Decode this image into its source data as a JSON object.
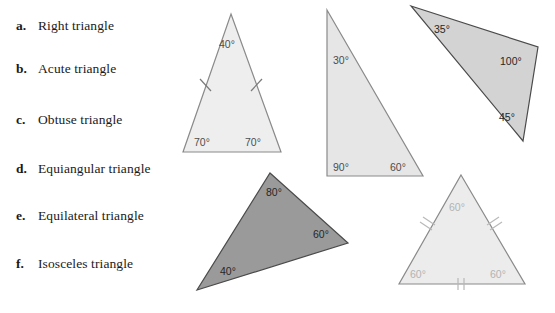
{
  "choices": [
    {
      "letter": "a.",
      "label": "Right triangle"
    },
    {
      "letter": "b.",
      "label": "Acute triangle"
    },
    {
      "letter": "c.",
      "label": "Obtuse triangle"
    },
    {
      "letter": "d.",
      "label": "Equiangular triangle"
    },
    {
      "letter": "e.",
      "label": "Equilateral triangle"
    },
    {
      "letter": "f.",
      "label": "Isosceles triangle"
    }
  ],
  "figures": {
    "isosceles": {
      "name": "isosceles-triangle",
      "fill": "#eeeeee",
      "angles": {
        "apex": "40°",
        "base_left": "70°",
        "base_right": "70°"
      },
      "tick_marks": "single tick on each of the two congruent legs"
    },
    "right": {
      "name": "right-triangle",
      "fill": "#e6e6e6",
      "angles": {
        "top": "30°",
        "bottom_left": "90°",
        "bottom_right": "60°"
      }
    },
    "obtuse": {
      "name": "obtuse-triangle",
      "fill": "#d3d3d3",
      "angles": {
        "left": "35°",
        "right": "100°",
        "bottom": "45°"
      }
    },
    "acute": {
      "name": "acute-triangle",
      "fill": "#9a9a9a",
      "angles": {
        "top": "80°",
        "right": "60°",
        "bottom_left": "40°"
      }
    },
    "equilateral": {
      "name": "equilateral-triangle",
      "fill": "#ececec",
      "angles": {
        "apex": "60°",
        "base_left": "60°",
        "base_right": "60°"
      },
      "tick_marks": "double tick on each of the three congruent sides"
    }
  }
}
